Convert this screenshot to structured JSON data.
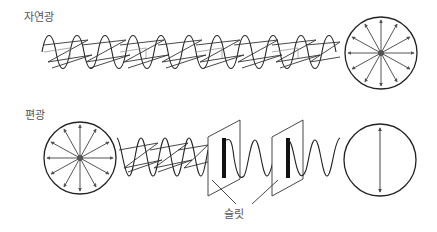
{
  "labels": {
    "natural_light": "자연광",
    "polarized_light": "편광",
    "slit": "슬릿"
  },
  "colors": {
    "stroke": "#222222",
    "arrow": "#555555",
    "slit_bar": "#111111",
    "text": "#555555",
    "background": "#ffffff"
  },
  "sections": [
    {
      "name": "natural-light",
      "label_key": "natural_light",
      "description": "unpolarized wave traveling right, ending in circle with arrows in all directions"
    },
    {
      "name": "polarized-light",
      "label_key": "polarized_light",
      "description": "circle with arrows in all directions, mixed wave passing two slits, exits as single vertical polarization"
    }
  ]
}
